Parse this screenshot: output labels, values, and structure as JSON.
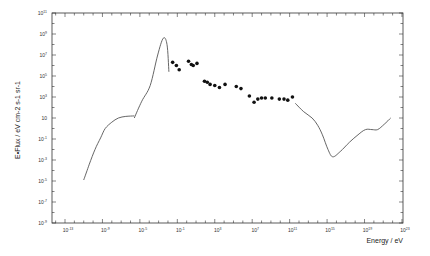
{
  "chart_data": {
    "type": "line",
    "title": "",
    "xlabel": "Energy / eV",
    "ylabel": "E•Flux / eV cm-2 s-1 sr-1",
    "xscale": "log",
    "yscale": "log",
    "xlim": [
      1e-14,
      1e+23
    ],
    "ylim": [
      1e-09,
      100000000000.0
    ],
    "grid": false,
    "legend": null,
    "x_tick_labels": [
      "10^-13",
      "10^-9",
      "10^-5",
      "10^-1",
      "10^3",
      "10^7",
      "10^11",
      "10^15",
      "10^19",
      "10^23"
    ],
    "x_tick_exponents": [
      -13,
      -9,
      -5,
      -1,
      3,
      7,
      11,
      15,
      19,
      23
    ],
    "y_tick_labels": [
      "10^11",
      "10^9",
      "10^7",
      "10^5",
      "10^3",
      "10",
      "10^-1",
      "10^-3",
      "10^-5",
      "10^-7",
      "10^-9"
    ],
    "y_tick_exponents": [
      11,
      9,
      7,
      5,
      3,
      1,
      -1,
      -3,
      -5,
      -7,
      -9
    ],
    "series": [
      {
        "name": "low-energy radio curve",
        "style": "line",
        "log10_x": [
          -11.0,
          -10.4,
          -9.8,
          -9.2,
          -8.7,
          -8.0,
          -7.3,
          -6.5,
          -5.6
        ],
        "log10_y": [
          -4.9,
          -3.4,
          -2.0,
          -0.9,
          0.0,
          0.6,
          1.0,
          1.15,
          1.2
        ]
      },
      {
        "name": "CMB peak curve",
        "style": "line",
        "log10_x": [
          -5.6,
          -4.8,
          -3.9,
          -3.1,
          -2.5,
          -2.1,
          -1.9
        ],
        "log10_y": [
          1.0,
          2.6,
          4.1,
          7.0,
          8.6,
          8.0,
          5.4
        ]
      },
      {
        "name": "measured points",
        "style": "scatter",
        "log10_x": [
          -1.5,
          -1.1,
          -0.8,
          0.2,
          0.5,
          0.7,
          1.1,
          1.9,
          2.2,
          2.5,
          3.0,
          3.5,
          4.1,
          5.3,
          5.8,
          6.7,
          7.2,
          7.6,
          8.0,
          8.4,
          9.1,
          9.9,
          10.4,
          10.8,
          11.3
        ],
        "log10_y": [
          6.3,
          6.0,
          5.6,
          6.4,
          6.1,
          6.0,
          6.2,
          4.5,
          4.4,
          4.2,
          4.1,
          3.9,
          4.2,
          4.0,
          3.8,
          3.1,
          2.5,
          2.8,
          2.9,
          2.9,
          2.9,
          2.8,
          2.8,
          2.7,
          3.0
        ]
      },
      {
        "name": "high-energy curve",
        "style": "line",
        "log10_x": [
          11.6,
          12.5,
          13.4,
          14.0,
          14.5,
          15.1,
          15.6,
          16.4,
          17.4,
          18.3,
          19.1,
          19.8,
          20.4,
          21.1,
          21.8
        ],
        "log10_y": [
          2.4,
          1.6,
          1.0,
          0.3,
          -0.6,
          -2.0,
          -2.7,
          -2.2,
          -1.3,
          -0.6,
          -0.1,
          -0.1,
          -0.1,
          0.4,
          1.0
        ]
      }
    ]
  },
  "axes": {
    "x_title": "Energy / eV",
    "y_title": "E•Flux / eV cm-2 s-1 sr-1"
  },
  "colors": {
    "frame": "#333333",
    "line": "#555555",
    "points": "#111111"
  }
}
